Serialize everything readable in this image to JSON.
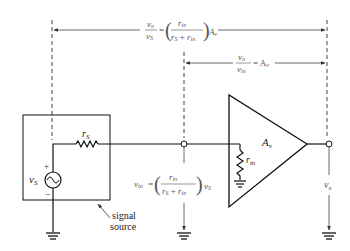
{
  "figure": {
    "type": "circuit-diagram"
  },
  "equations": {
    "overall_gain": {
      "lhs_num": "v",
      "lhs_num_sub": "o",
      "lhs_den": "v",
      "lhs_den_sub": "S",
      "eq": "=",
      "frac_num": "r",
      "frac_num_sub": "in",
      "frac_den_a": "r",
      "frac_den_a_sub": "S",
      "frac_den_plus": "+",
      "frac_den_b": "r",
      "frac_den_b_sub": "in",
      "factor": "A",
      "factor_sub": "v"
    },
    "amp_gain": {
      "lhs_num": "v",
      "lhs_num_sub": "o",
      "lhs_den": "v",
      "lhs_den_sub": "in",
      "eq": "= A",
      "factor_sub": "v"
    },
    "input_voltage": {
      "lhs": "v",
      "lhs_sub": "in",
      "eq": "=",
      "frac_num": "r",
      "frac_num_sub": "in",
      "frac_den_a": "r",
      "frac_den_a_sub": "S",
      "frac_den_plus": "+",
      "frac_den_b": "r",
      "frac_den_b_sub": "in",
      "factor": "v",
      "factor_sub": "S"
    }
  },
  "components": {
    "source_resistor": {
      "label": "r",
      "sub": "S"
    },
    "source_voltage": {
      "label": "v",
      "sub": "S",
      "plus": "+",
      "minus": "−"
    },
    "input_resistor": {
      "label": "r",
      "sub": "in"
    },
    "amplifier": {
      "label": "A",
      "sub": "v"
    },
    "output_voltage": {
      "label": "v",
      "sub": "o"
    }
  },
  "annotations": {
    "signal_source_line1": "signal",
    "signal_source_line2": "source"
  },
  "colors": {
    "wire": "#111111",
    "dim_line": "#444444",
    "equation_text": "#555555"
  }
}
